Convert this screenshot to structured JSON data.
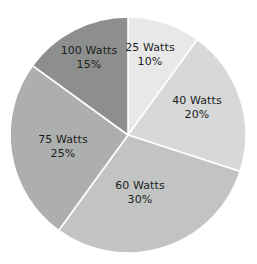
{
  "chart_data": {
    "type": "pie",
    "title": "",
    "subtitle": "",
    "xlabel": "",
    "ylabel": "",
    "legend_position": "none",
    "grid": false,
    "labels_inside_slices": true,
    "start_angle_deg": 0,
    "direction": "clockwise",
    "categories": [
      "25 Watts",
      "40 Watts",
      "60 Watts",
      "75 Watts",
      "100 Watts"
    ],
    "values": [
      10,
      20,
      30,
      25,
      15
    ],
    "value_unit": "%",
    "colors": [
      "#e8e8e8",
      "#d7d9d8",
      "#c2c4c3",
      "#adafae",
      "#8d8f8e"
    ],
    "slices": [
      {
        "name": "25 Watts",
        "percent_label": "10%",
        "value": 10,
        "color": "#e8e8e8",
        "label_x": 150,
        "label_y": 54
      },
      {
        "name": "40 Watts",
        "percent_label": "20%",
        "value": 20,
        "color": "#d7d9d8",
        "label_x": 197,
        "label_y": 107
      },
      {
        "name": "60 Watts",
        "percent_label": "30%",
        "value": 30,
        "color": "#c2c4c3",
        "label_x": 140,
        "label_y": 192
      },
      {
        "name": "75 Watts",
        "percent_label": "25%",
        "value": 25,
        "color": "#adafae",
        "label_x": 63,
        "label_y": 146
      },
      {
        "name": "100 Watts",
        "percent_label": "15%",
        "value": 15,
        "color": "#8d8f8e",
        "label_x": 89,
        "label_y": 57
      }
    ],
    "geometry": {
      "center_x": 128,
      "center_y": 135,
      "radius": 118
    },
    "background_color": "#ffffff",
    "label_text_color": "#1c1c1c",
    "slice_border_color": "#ffffff"
  }
}
